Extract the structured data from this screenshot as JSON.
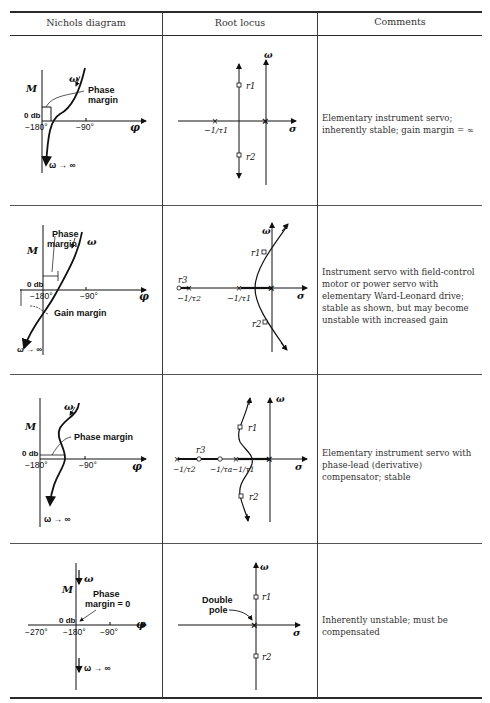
{
  "table": {
    "headers": [
      "Nichols diagram",
      "Root locus",
      "Comments"
    ],
    "rows": [
      {
        "nichols": {
          "y_axis": "M",
          "x_axis": "φ",
          "zero_db": "0 db",
          "ticks": [
            "−180°",
            "−90°"
          ],
          "labels": [
            "ω",
            "Phase",
            "margin",
            "ω → ∞"
          ]
        },
        "root_locus": {
          "axes": [
            "ω",
            "σ"
          ],
          "poles": [
            "−1/τ1"
          ],
          "roots": [
            "r1",
            "r2"
          ]
        },
        "comment": "Elementary instrument servo; inherently stable; gain margin = ∞"
      },
      {
        "nichols": {
          "y_axis": "M",
          "x_axis": "φ",
          "zero_db": "0 db",
          "ticks": [
            "−180°",
            "−90°"
          ],
          "labels": [
            "Phase",
            "margin",
            "ω",
            "Gain margin",
            "ω → ∞"
          ]
        },
        "root_locus": {
          "axes": [
            "ω",
            "σ"
          ],
          "poles": [
            "−1/τ2",
            "−1/τ1"
          ],
          "roots": [
            "r1",
            "r2",
            "r3"
          ]
        },
        "comment": "Instrument servo with field-control motor or power servo with elementary Ward-Leonard drive; stable as shown, but may become unstable with increased gain"
      },
      {
        "nichols": {
          "y_axis": "M",
          "x_axis": "φ",
          "zero_db": "0 db",
          "ticks": [
            "−180°",
            "−90°"
          ],
          "labels": [
            "ω",
            "Phase margin",
            "ω → ∞"
          ]
        },
        "root_locus": {
          "axes": [
            "ω",
            "σ"
          ],
          "poles": [
            "−1/τ2",
            "−1/τa",
            "−1/τ1"
          ],
          "roots": [
            "r1",
            "r2",
            "r3"
          ]
        },
        "comment": "Elementary instrument servo with phase-lead (derivative) compensator; stable"
      },
      {
        "nichols": {
          "y_axis": "M",
          "x_axis": "φ",
          "zero_db": "0 db",
          "ticks": [
            "−270°",
            "−180°",
            "−90°"
          ],
          "labels": [
            "ω",
            "Phase",
            "margin = 0",
            "ω → ∞"
          ]
        },
        "root_locus": {
          "axes": [
            "ω",
            "σ"
          ],
          "annotation": "Double pole",
          "annotation_line2": "pole",
          "annotation_line1": "Double",
          "roots": [
            "r1",
            "r2"
          ]
        },
        "comment": "Inherently unstable; must be compensated"
      }
    ]
  }
}
